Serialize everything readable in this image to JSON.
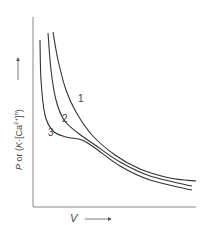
{
  "chart_data": {
    "type": "line",
    "title": "",
    "xlabel": "V",
    "ylabel": "P or (K·[Ca2+]n)",
    "x_arrow": true,
    "y_arrow": true,
    "grid": false,
    "ticks": false,
    "series": [
      {
        "name": "1",
        "description": "highest, smooth hyperbolic decay",
        "points": [
          [
            53,
            32
          ],
          [
            58,
            60
          ],
          [
            66,
            90
          ],
          [
            76,
            112
          ],
          [
            92,
            135
          ],
          [
            115,
            155
          ],
          [
            140,
            169
          ],
          [
            170,
            178
          ],
          [
            196,
            181
          ]
        ]
      },
      {
        "name": "2",
        "description": "middle, slight inflection",
        "points": [
          [
            48,
            33
          ],
          [
            51,
            70
          ],
          [
            56,
            100
          ],
          [
            64,
            120
          ],
          [
            78,
            133
          ],
          [
            95,
            145
          ],
          [
            120,
            162
          ],
          [
            150,
            176
          ],
          [
            192,
            186
          ]
        ]
      },
      {
        "name": "3",
        "description": "lowest, plateau / shoulder region",
        "points": [
          [
            40,
            40
          ],
          [
            41,
            80
          ],
          [
            45,
            115
          ],
          [
            53,
            131
          ],
          [
            66,
            137
          ],
          [
            82,
            140
          ],
          [
            95,
            148
          ],
          [
            120,
            166
          ],
          [
            150,
            180
          ],
          [
            192,
            190
          ]
        ]
      }
    ],
    "curve_labels": [
      {
        "text": "1",
        "x": 78,
        "y": 102
      },
      {
        "text": "2",
        "x": 62,
        "y": 122
      },
      {
        "text": "3",
        "x": 48,
        "y": 136
      }
    ]
  },
  "axes": {
    "x_label_var": "V",
    "y_label_p": "P",
    "y_label_or": " or (",
    "y_label_k": "K",
    "y_label_ca": "·[Ca",
    "y_label_sup": "2+",
    "y_label_close": "]",
    "y_label_n": "n",
    "y_label_end": ")"
  },
  "colors": {
    "axis": "#777777",
    "curve": "#333333"
  }
}
